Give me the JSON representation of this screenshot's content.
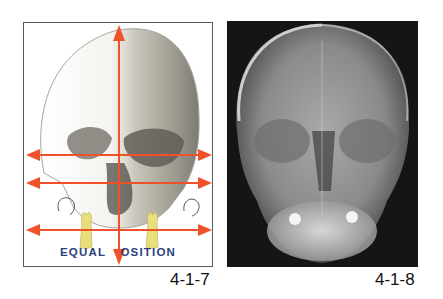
{
  "figures": [
    {
      "id": "4-1-7",
      "caption": "4-1-7",
      "type": "illustration",
      "description": "Frontal skull drawing with red orientation arrows",
      "banner_text": "EQUAL POSITION",
      "banner_left": "EQUAL ",
      "banner_right": "OSITION",
      "arrow_color": "#f0502a",
      "banner_color": "#2b3f7e",
      "frame_color": "#555a60",
      "tooth_color": "#e9df7a"
    },
    {
      "id": "4-1-8",
      "caption": "4-1-8",
      "type": "radiograph",
      "description": "Posteroanterior skull X-ray"
    }
  ]
}
